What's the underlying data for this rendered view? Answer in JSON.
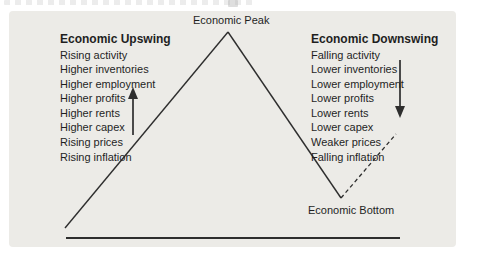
{
  "figure": {
    "peak_label": "Economic Peak",
    "bottom_label": "Economic Bottom",
    "upswing": {
      "title": "Economic Upswing",
      "items": [
        "Rising activity",
        "Higher inventories",
        "Higher employment",
        "Higher profits",
        "Higher rents",
        "Higher capex",
        "Rising prices",
        "Rising inflation"
      ]
    },
    "downswing": {
      "title": "Economic Downswing",
      "items": [
        "Falling activity",
        "Lower inventories",
        "Lower employment",
        "Lower profits",
        "Lower rents",
        "Lower capex",
        "Weaker prices",
        "Falling inflation"
      ]
    },
    "colors": {
      "panel_bg": "#ecebe7",
      "line": "#2e2e2e",
      "text": "#1f1f1f"
    }
  }
}
